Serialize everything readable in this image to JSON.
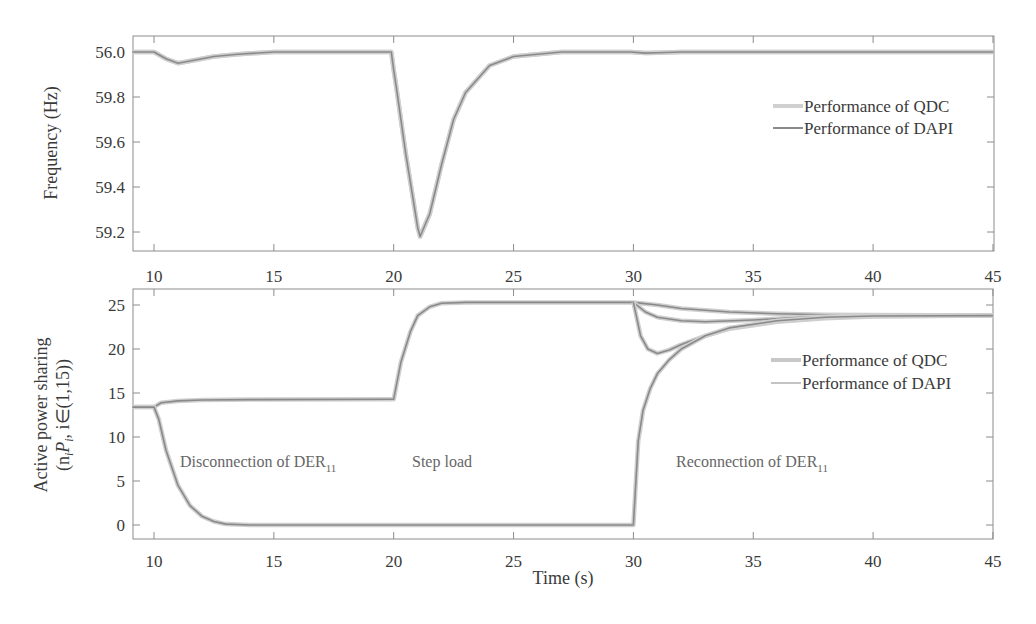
{
  "figure": {
    "xlabel": "Time (s)"
  },
  "chart_data": [
    {
      "type": "line",
      "title": "",
      "xlabel": "",
      "ylabel": "Frequency (Hz)",
      "xlim": [
        9.1,
        45
      ],
      "ylim": [
        59.12,
        60.07
      ],
      "x_ticks": [
        10,
        15,
        20,
        25,
        30,
        35,
        40,
        45
      ],
      "y_ticks": [
        60.0,
        59.8,
        59.6,
        59.4,
        59.2
      ],
      "y_tick_labels": [
        "56.0",
        "59.8",
        "59.6",
        "59.4",
        "59.2"
      ],
      "grid": false,
      "legend": {
        "position": "upper right (mid)",
        "entries": [
          "Performance of QDC",
          "Performance of DAPI"
        ]
      },
      "series": [
        {
          "name": "Performance of QDC",
          "color": "#c8c8c8",
          "x": [
            9.1,
            10.0,
            10.5,
            11.0,
            11.5,
            12.5,
            13.5,
            15,
            17,
            19.9,
            20.0,
            20.1,
            20.5,
            21.0,
            21.1,
            21.5,
            22.0,
            22.5,
            23.0,
            24.0,
            25.0,
            26.0,
            27.0,
            29.9,
            30.5,
            31.0,
            32,
            35,
            40,
            45
          ],
          "values": [
            60.0,
            60.0,
            59.97,
            59.95,
            59.96,
            59.98,
            59.99,
            60.0,
            60.0,
            60.0,
            59.92,
            59.85,
            59.55,
            59.22,
            59.18,
            59.28,
            59.5,
            59.7,
            59.82,
            59.94,
            59.98,
            59.99,
            60.0,
            60.0,
            59.995,
            59.997,
            60.0,
            60.0,
            60.0,
            60.0
          ]
        },
        {
          "name": "Performance of DAPI",
          "color": "#8a8a8a",
          "x": [
            9.1,
            10.0,
            10.5,
            11.0,
            11.5,
            12.5,
            13.5,
            15,
            17,
            19.9,
            20.0,
            20.1,
            20.5,
            21.0,
            21.1,
            21.5,
            22.0,
            22.5,
            23.0,
            24.0,
            25.0,
            26.0,
            27.0,
            29.9,
            30.5,
            31.0,
            32,
            35,
            40,
            45
          ],
          "values": [
            60.0,
            60.0,
            59.97,
            59.95,
            59.96,
            59.98,
            59.99,
            60.0,
            60.0,
            60.0,
            59.92,
            59.85,
            59.55,
            59.22,
            59.18,
            59.28,
            59.5,
            59.7,
            59.82,
            59.94,
            59.98,
            59.99,
            60.0,
            60.0,
            59.995,
            59.997,
            60.0,
            60.0,
            60.0,
            60.0
          ]
        }
      ]
    },
    {
      "type": "line",
      "title": "",
      "xlabel": "Time (s)",
      "ylabel": "Active power sharing (n_i P_i, i∈(1,15))",
      "ylabel_line1": "Active power sharing",
      "ylabel_line2": "(n",
      "ylabel_line2_sub_i": "i",
      "ylabel_line2_mid": "P",
      "ylabel_line2_sub_i2": "i",
      "ylabel_line2_rest": ", i∈(1,15))",
      "xlim": [
        9.1,
        45
      ],
      "ylim": [
        -1.6,
        26.8
      ],
      "x_ticks": [
        10,
        15,
        20,
        25,
        30,
        35,
        40,
        45
      ],
      "y_ticks": [
        0,
        5,
        10,
        15,
        20,
        25
      ],
      "grid": false,
      "legend": {
        "position": "right (mid)",
        "entries": [
          "Performance of QDC",
          "Performance of DAPI"
        ]
      },
      "annotations": [
        {
          "text": "Disconnection of DER",
          "sub": "11",
          "x": 11.2,
          "y": 8.5
        },
        {
          "text": "Step load",
          "x": 21.0,
          "y": 8.5
        },
        {
          "text": "Reconnection of DER",
          "sub": "11",
          "x": 32.0,
          "y": 8.5
        }
      ],
      "series": [
        {
          "name": "Other DERs (QDC & DAPI, overlapping)",
          "color": "#9a9a9a",
          "x": [
            9.1,
            10.0,
            10.3,
            11.0,
            12.0,
            14,
            19.9,
            20.0,
            20.3,
            20.7,
            21.0,
            21.5,
            22.0,
            23.0,
            25.0,
            29.9,
            30.0,
            31,
            32,
            34,
            36,
            38,
            40,
            45
          ],
          "values": [
            13.4,
            13.4,
            13.9,
            14.1,
            14.2,
            14.25,
            14.3,
            14.3,
            18.5,
            22.0,
            23.8,
            24.8,
            25.2,
            25.3,
            25.3,
            25.3,
            25.3,
            25.0,
            24.6,
            24.2,
            24.0,
            23.9,
            23.85,
            23.8
          ]
        },
        {
          "name": "Other DERs lower band",
          "color": "#9a9a9a",
          "x": [
            30.0,
            30.5,
            31,
            32,
            33,
            35,
            37,
            40,
            45
          ],
          "values": [
            25.3,
            24.2,
            23.6,
            23.2,
            23.1,
            23.3,
            23.6,
            23.8,
            23.8
          ]
        },
        {
          "name": "Dipping DER",
          "color": "#8a8a8a",
          "x": [
            30.0,
            30.3,
            30.6,
            31.0,
            31.5,
            32,
            33,
            34,
            36,
            38,
            40,
            45
          ],
          "values": [
            25.3,
            21.5,
            20.0,
            19.5,
            19.9,
            20.5,
            21.5,
            22.3,
            23.1,
            23.5,
            23.7,
            23.8
          ]
        },
        {
          "name": "DER11",
          "color": "#8a8a8a",
          "x": [
            9.1,
            10.0,
            10.2,
            10.5,
            11.0,
            11.5,
            12.0,
            12.5,
            13.0,
            14.0,
            15,
            20,
            25,
            29.9,
            30.0,
            30.2,
            30.4,
            30.7,
            31.0,
            31.5,
            32,
            33,
            34,
            36,
            38,
            40,
            45
          ],
          "values": [
            13.4,
            13.4,
            12.0,
            8.5,
            4.5,
            2.2,
            1.0,
            0.4,
            0.1,
            0.0,
            0.0,
            0.0,
            0.0,
            0.0,
            0.0,
            9.5,
            13.0,
            15.5,
            17.2,
            18.8,
            20.0,
            21.5,
            22.4,
            23.2,
            23.6,
            23.75,
            23.8
          ]
        }
      ]
    }
  ]
}
